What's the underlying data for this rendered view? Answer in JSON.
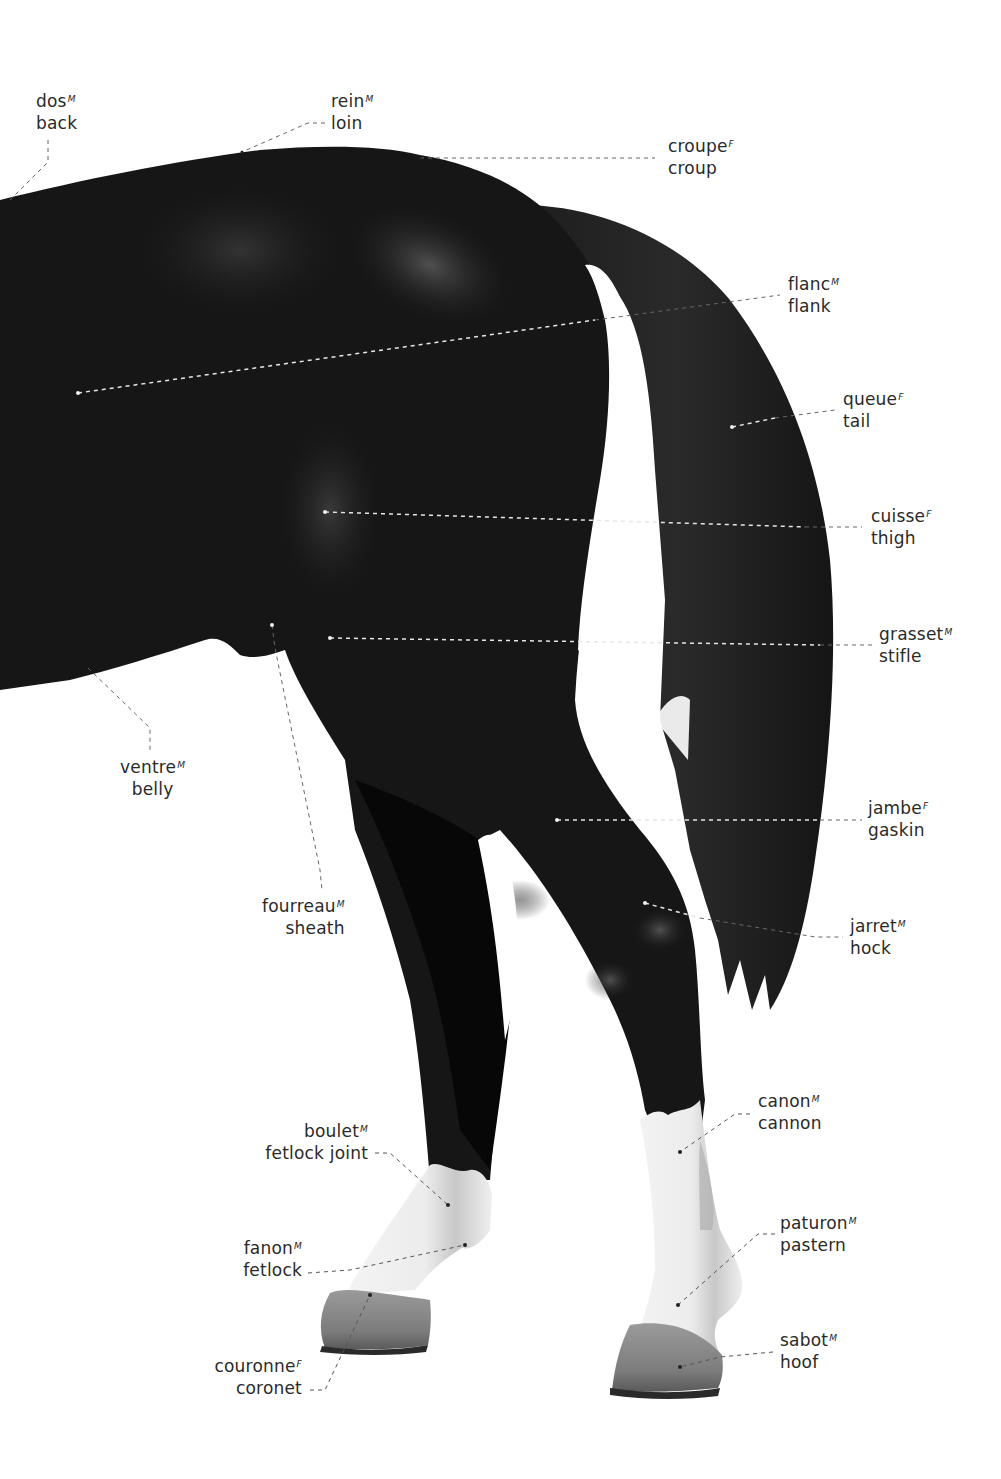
{
  "diagram": {
    "colors": {
      "coat": "#141414",
      "coat_highlight": "#4a4a4a",
      "white_markings": "#f0f0f0",
      "hoof": "#8a8a8a",
      "label_text": "#2a2a2a",
      "leader_on_body": "#e8e8e8",
      "leader_on_white": "#555555"
    },
    "labels": [
      {
        "id": "dos",
        "fr": "dos",
        "gender": "M",
        "en": "back"
      },
      {
        "id": "rein",
        "fr": "rein",
        "gender": "M",
        "en": "loin"
      },
      {
        "id": "croupe",
        "fr": "croupe",
        "gender": "F",
        "en": "croup"
      },
      {
        "id": "flanc",
        "fr": "flanc",
        "gender": "M",
        "en": "flank"
      },
      {
        "id": "queue",
        "fr": "queue",
        "gender": "F",
        "en": "tail"
      },
      {
        "id": "cuisse",
        "fr": "cuisse",
        "gender": "F",
        "en": "thigh"
      },
      {
        "id": "grasset",
        "fr": "grasset",
        "gender": "M",
        "en": "stifle"
      },
      {
        "id": "ventre",
        "fr": "ventre",
        "gender": "M",
        "en": "belly"
      },
      {
        "id": "fourreau",
        "fr": "fourreau",
        "gender": "M",
        "en": "sheath"
      },
      {
        "id": "jambe",
        "fr": "jambe",
        "gender": "F",
        "en": "gaskin"
      },
      {
        "id": "jarret",
        "fr": "jarret",
        "gender": "M",
        "en": "hock"
      },
      {
        "id": "canon",
        "fr": "canon",
        "gender": "M",
        "en": "cannon"
      },
      {
        "id": "boulet",
        "fr": "boulet",
        "gender": "M",
        "en": "fetlock joint"
      },
      {
        "id": "paturon",
        "fr": "paturon",
        "gender": "M",
        "en": "pastern"
      },
      {
        "id": "fanon",
        "fr": "fanon",
        "gender": "M",
        "en": "fetlock"
      },
      {
        "id": "sabot",
        "fr": "sabot",
        "gender": "M",
        "en": "hoof"
      },
      {
        "id": "couronne",
        "fr": "couronne",
        "gender": "F",
        "en": "coronet"
      }
    ]
  }
}
